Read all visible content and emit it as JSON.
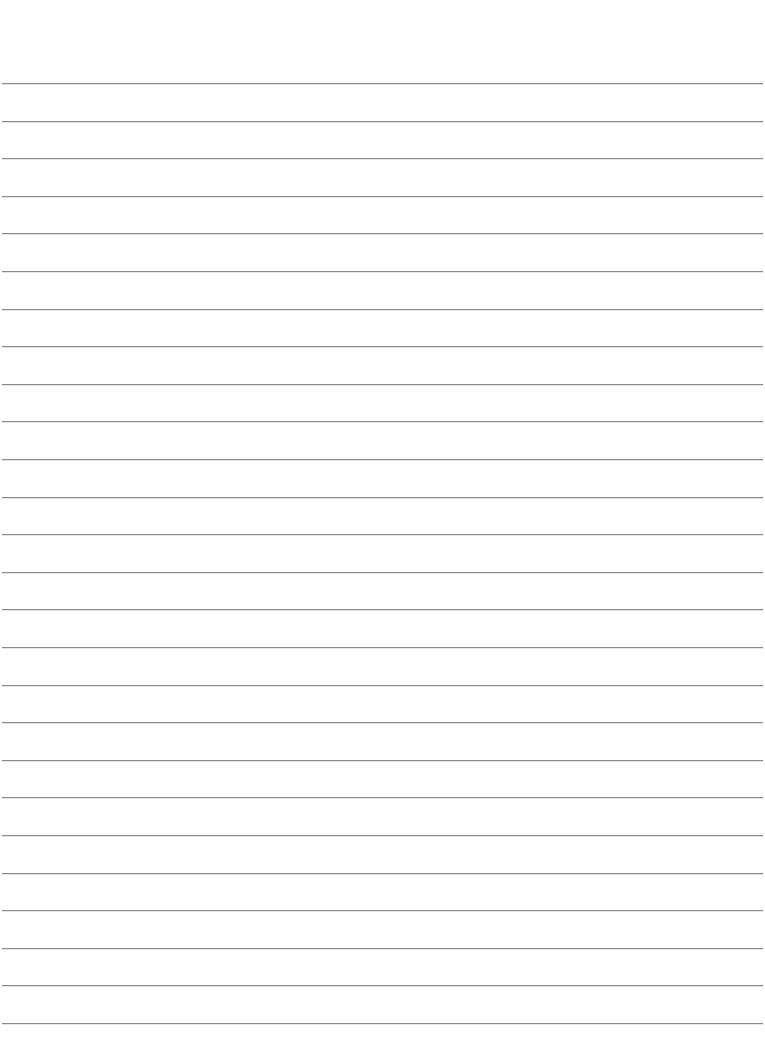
{
  "page": {
    "type": "lined-paper",
    "background_color": "#ffffff",
    "line_color": "#8a8a8a",
    "line_count": 26,
    "first_line_y": 83,
    "line_spacing": 37.6
  }
}
